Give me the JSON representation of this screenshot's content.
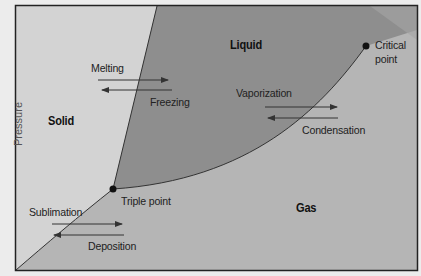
{
  "diagram": {
    "axis": {
      "y_label": "Pressure"
    },
    "regions": {
      "solid": "Solid",
      "liquid": "Liquid",
      "gas": "Gas"
    },
    "points": {
      "triple": "Triple point",
      "critical_line1": "Critical",
      "critical_line2": "point"
    },
    "transitions": {
      "melting": "Melting",
      "freezing": "Freezing",
      "vaporization": "Vaporization",
      "condensation": "Condensation",
      "sublimation": "Sublimation",
      "deposition": "Deposition"
    },
    "colors": {
      "solid_fill": "#d3d3d3",
      "liquid_fill": "#8e8e8e",
      "gas_fill": "#b5b5b5",
      "border": "#222222",
      "page_bg": "#ececec"
    }
  }
}
